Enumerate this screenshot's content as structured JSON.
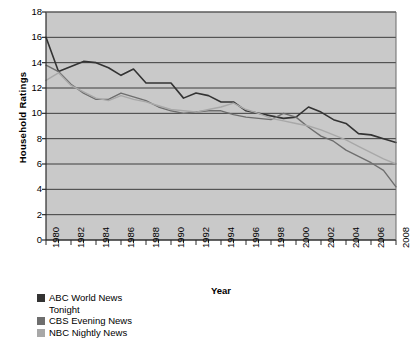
{
  "chart_data": {
    "type": "line",
    "title": "",
    "xlabel": "Year",
    "ylabel": "Household Ratings",
    "xlim": [
      1980,
      2008
    ],
    "ylim": [
      0,
      18
    ],
    "ytick_step": 2,
    "xtick_step": 2,
    "grid": true,
    "grid_axis": "y",
    "legend_position": "bottom-left",
    "plot_background": "#c9c9c9",
    "x": [
      1980,
      1981,
      1982,
      1983,
      1984,
      1985,
      1986,
      1987,
      1988,
      1989,
      1990,
      1991,
      1992,
      1993,
      1994,
      1995,
      1996,
      1997,
      1998,
      1999,
      2000,
      2001,
      2002,
      2003,
      2004,
      2005,
      2006,
      2007,
      2008
    ],
    "xticks": [
      "1980",
      "1982",
      "1984",
      "1986",
      "1988",
      "1990",
      "1992",
      "1994",
      "1996",
      "1998",
      "2000",
      "2002",
      "2004",
      "2006",
      "2008"
    ],
    "yticks": [
      "0",
      "2",
      "4",
      "6",
      "8",
      "10",
      "12",
      "14",
      "16",
      "18"
    ],
    "series": [
      {
        "name": "ABC World News Tonight",
        "color": "#333333",
        "values": [
          16.0,
          13.3,
          13.7,
          14.1,
          14.0,
          13.6,
          13.0,
          13.5,
          12.4,
          12.4,
          12.4,
          11.2,
          11.6,
          11.4,
          10.9,
          10.9,
          10.2,
          10.0,
          9.8,
          9.6,
          9.7,
          10.5,
          10.1,
          9.5,
          9.2,
          8.4,
          8.3,
          8.0,
          7.7
        ]
      },
      {
        "name": "CBS Evening News",
        "color": "#6e6e6e",
        "values": [
          13.8,
          13.3,
          12.3,
          11.6,
          11.1,
          11.1,
          11.6,
          11.3,
          11.0,
          10.5,
          10.2,
          10.0,
          10.1,
          10.2,
          10.2,
          9.9,
          9.7,
          9.6,
          9.5,
          10.0,
          9.7,
          8.9,
          8.2,
          7.8,
          7.1,
          6.6,
          6.1,
          5.5,
          4.2
        ]
      },
      {
        "name": "NBC Nightly News",
        "color": "#a8a8a8",
        "values": [
          12.6,
          13.2,
          12.2,
          11.7,
          11.2,
          11.0,
          11.4,
          11.1,
          10.9,
          10.6,
          10.3,
          10.2,
          10.1,
          10.3,
          10.5,
          10.8,
          10.3,
          10.0,
          9.6,
          9.4,
          9.2,
          9.0,
          8.7,
          8.3,
          7.9,
          7.4,
          6.9,
          6.4,
          6.0
        ]
      }
    ],
    "legend": [
      {
        "label": "ABC World News\nTonight",
        "color": "#333333"
      },
      {
        "label": "CBS Evening News",
        "color": "#6e6e6e"
      },
      {
        "label": "NBC Nightly News",
        "color": "#a8a8a8"
      }
    ]
  }
}
